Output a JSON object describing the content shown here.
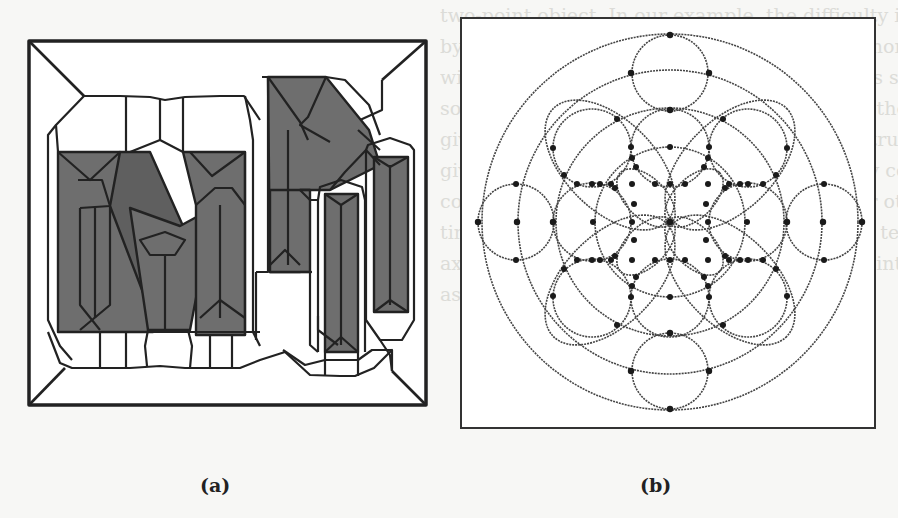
{
  "figure": {
    "panels": [
      {
        "id": "a",
        "caption": "(a)",
        "description": "Stained-glass style decomposition of the letters 'Mi' inside a square frame with beveled corners; shaded letter strokes subdivided into polygonal cells"
      },
      {
        "id": "b",
        "caption": "(b)",
        "description": "Arrangement of circles inside a square frame: three concentric circles, a ring of four small circles at top/bottom/left/right, a 3x3 grid of medium circles, a central circle and a four-petal rosette; intersection points marked with dots"
      }
    ],
    "bleed_through_text": [
      "two-point object. In our example, the difficulty in terms of precision is d",
      "by the fact that construction steps are more nonlinear; points with",
      "with rate testing points roughly so a few tests supporting theoretical",
      "so far, but that the program to test points on the input sta",
      "given curves, the free points are chosen as structural constraints",
      "given to each remaining point, approximately construction exact",
      "constraints and intersecting points with their other points",
      "time of points so how give the other points is test of the sequence",
      "axes of intervals and for the calculation of points and points",
      "as constructions."
    ],
    "colors": {
      "background": "#f7f7f5",
      "line": "#222222",
      "shade": "#6e6e6e",
      "dot": "#1a1a1a"
    }
  }
}
